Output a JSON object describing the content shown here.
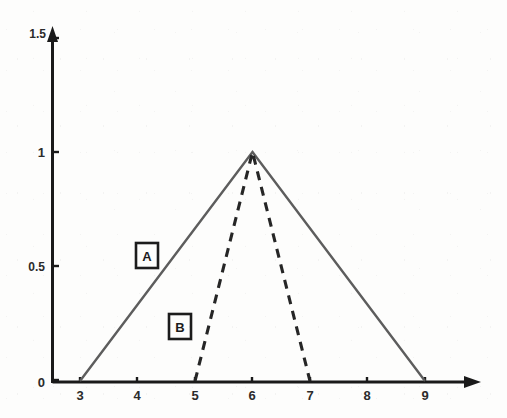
{
  "chart_data": {
    "type": "line",
    "title": "",
    "subtitle": "",
    "xlabel": "",
    "ylabel": "",
    "xlim": [
      2.5,
      9.8
    ],
    "ylim": [
      0,
      1.5
    ],
    "x_ticks": [
      3,
      4,
      5,
      6,
      7,
      8,
      9
    ],
    "x_tick_labels": [
      "3",
      "4",
      "5",
      "6",
      "7",
      "8",
      "9"
    ],
    "y_ticks": [
      0,
      0.5,
      1,
      1.5
    ],
    "y_tick_labels": [
      "0",
      "0.5",
      "1",
      "1.5"
    ],
    "grid": false,
    "legend_position": "inline-boxed-annotations",
    "axis_arrows": true,
    "series": [
      {
        "name": "A",
        "style": "solid",
        "color": "#5d5d5d",
        "x": [
          3,
          6,
          9
        ],
        "values": [
          0,
          1,
          0
        ],
        "annotation_label": "A"
      },
      {
        "name": "B",
        "style": "dashed",
        "color": "#262626",
        "x": [
          5,
          6,
          7
        ],
        "values": [
          0,
          1,
          0
        ],
        "annotation_label": "B"
      }
    ],
    "annotations": [
      {
        "label": "A",
        "x": 4.0,
        "y": 0.56
      },
      {
        "label": "B",
        "x": 4.6,
        "y": 0.3
      }
    ]
  },
  "axis": {
    "x_label_3": "3",
    "x_label_4": "4",
    "x_label_5": "5",
    "x_label_6": "6",
    "x_label_7": "7",
    "x_label_8": "8",
    "x_label_9": "9",
    "y_label_0": "0",
    "y_label_0_5": "0.5",
    "y_label_1": "1",
    "y_label_1_5": "1.5"
  },
  "labels": {
    "series_a": "A",
    "series_b": "B"
  },
  "colors": {
    "axis": "#1a1a1a",
    "series_a": "#5d5d5d",
    "series_b": "#262626",
    "background": "#fdfdfc"
  }
}
